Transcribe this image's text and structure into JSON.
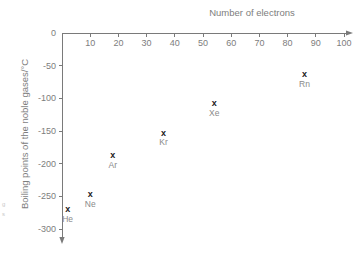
{
  "chart_data": {
    "type": "scatter",
    "title": "",
    "xlabel": "Number of electrons",
    "ylabel": "Boiling points of the noble gases/°C",
    "xlim": [
      0,
      100
    ],
    "ylim": [
      -300,
      0
    ],
    "grid": false,
    "legend": "none",
    "x_ticks": [
      "0",
      "10",
      "20",
      "30",
      "40",
      "50",
      "60",
      "70",
      "80",
      "90",
      "100"
    ],
    "x_tick_values": [
      0,
      10,
      20,
      30,
      40,
      50,
      60,
      70,
      80,
      90,
      100
    ],
    "y_ticks": [
      "0",
      "-50",
      "-100",
      "-150",
      "-200",
      "-250",
      "-300"
    ],
    "y_tick_values": [
      0,
      -50,
      -100,
      -150,
      -200,
      -250,
      -300
    ],
    "x_axis_position": "top",
    "marker_symbol": "x",
    "marker_color": "#1b1b1b",
    "axis_color": "#7a7a7a",
    "text_color": "#7d7d7d",
    "points": [
      {
        "label": "He",
        "x": 2,
        "y": -269
      },
      {
        "label": "Ne",
        "x": 10,
        "y": -246
      },
      {
        "label": "Ar",
        "x": 18,
        "y": -186
      },
      {
        "label": "Kr",
        "x": 36,
        "y": -152
      },
      {
        "label": "Xe",
        "x": 54,
        "y": -107
      },
      {
        "label": "Rn",
        "x": 86,
        "y": -62
      }
    ]
  },
  "edge_artifact": {
    "line1": "g",
    "line2": "s"
  }
}
